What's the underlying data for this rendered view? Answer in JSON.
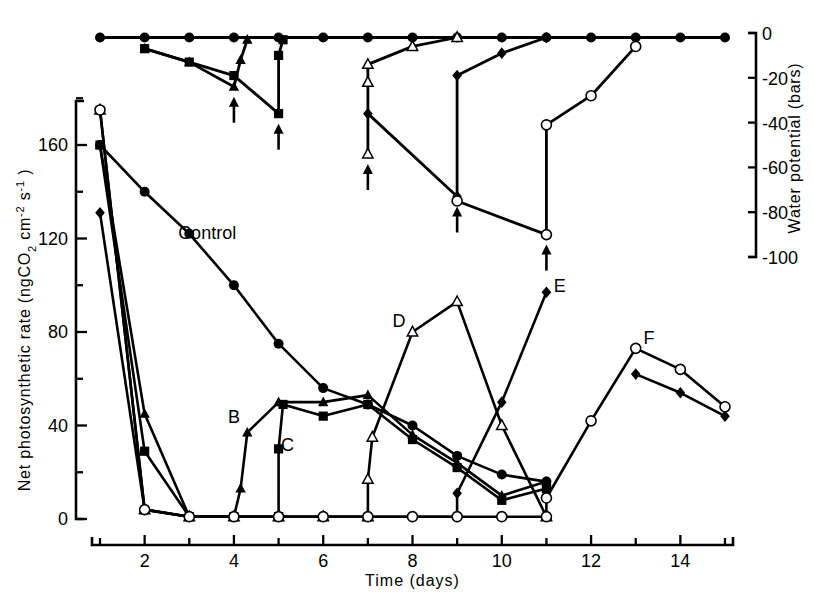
{
  "figure": {
    "title": "",
    "left_axis_label": "Net photosynthetic rate  (ngCO₂ cm⁻² s⁻¹)",
    "right_axis_label": "Water potential  (bars)",
    "x_axis_label": "Time  (days)"
  },
  "chart_data": {
    "type": "line",
    "title": "",
    "xlabel": "Time (days)",
    "ylabel": "Net photosynthetic rate (ngCO2 cm-2 s-1)",
    "ylabel_right": "Water potential (bars)",
    "xlim": [
      1,
      15
    ],
    "ylim": [
      0,
      180
    ],
    "ylim_right": [
      -100,
      0
    ],
    "grid": false,
    "legend": "none",
    "xticks": [
      1,
      2,
      3,
      4,
      5,
      6,
      7,
      8,
      9,
      10,
      11,
      12,
      13,
      14,
      15
    ],
    "xticklabels": [
      "",
      "2",
      "",
      "4",
      "",
      "6",
      "",
      "8",
      "",
      "10",
      "",
      "12",
      "",
      "14",
      ""
    ],
    "yticks_left": [
      0,
      20,
      40,
      60,
      80,
      100,
      120,
      140,
      160,
      180
    ],
    "yticklabels_left": [
      "0",
      "",
      "40",
      "",
      "80",
      "",
      "120",
      "",
      "160",
      ""
    ],
    "yticks_right": [
      0,
      -10,
      -20,
      -30,
      -40,
      -50,
      -60,
      -70,
      -80,
      -90,
      -100
    ],
    "yticklabels_right": [
      "0",
      "",
      "-20",
      "",
      "-40",
      "",
      "-60",
      "",
      "-80",
      "",
      "-100"
    ],
    "annotations": [
      {
        "text": "Control",
        "x": 3.4,
        "y": 120
      },
      {
        "text": "B",
        "x": 4.0,
        "y": 41
      },
      {
        "text": "C",
        "x": 5.2,
        "y": 29
      },
      {
        "text": "D",
        "x": 7.7,
        "y": 82
      },
      {
        "text": "E",
        "x": 11.3,
        "y": 97
      },
      {
        "text": "F",
        "x": 13.3,
        "y": 75
      }
    ],
    "rewater_arrows_panel_top": [
      {
        "x": 4.0,
        "y_bars": -24
      },
      {
        "x": 5.0,
        "y_bars": -36
      },
      {
        "x": 7.0,
        "y_bars": -54
      },
      {
        "x": 9.0,
        "y_bars": -73
      },
      {
        "x": 11.0,
        "y_bars": -90
      }
    ],
    "series_top_panel": [
      {
        "name": "control-water-potential",
        "marker": "filled-circle",
        "x": [
          1,
          2,
          3,
          4,
          5,
          6,
          7,
          8,
          9,
          10,
          11,
          12,
          13,
          14,
          15
        ],
        "y_bars": [
          -2,
          -2,
          -2,
          -2,
          -2,
          -2,
          -2,
          -2,
          -2,
          -2,
          -2,
          -2,
          -2,
          -2,
          -2
        ]
      },
      {
        "name": "B-water-potential-triangle",
        "marker": "filled-triangle",
        "x": [
          2,
          3,
          4,
          4.15,
          4.3
        ],
        "y_bars": [
          -7,
          -13,
          -24,
          -12,
          -3
        ]
      },
      {
        "name": "C-water-potential-square",
        "marker": "filled-square",
        "x": [
          2,
          3,
          4,
          5,
          5,
          5.1
        ],
        "y_bars": [
          -7,
          -13,
          -19,
          -36,
          -10,
          -3
        ]
      },
      {
        "name": "D-water-potential-open-triangle",
        "marker": "open-triangle",
        "x": [
          7,
          7,
          7,
          8,
          9
        ],
        "y_bars": [
          -54,
          -22,
          -14,
          -6,
          -2
        ]
      },
      {
        "name": "E-water-potential-diamond",
        "marker": "filled-diamond",
        "x": [
          7,
          9,
          9,
          10,
          11
        ],
        "y_bars": [
          -36,
          -73,
          -19,
          -9,
          -2
        ]
      },
      {
        "name": "F-water-potential-open-circle",
        "marker": "open-circle",
        "x": [
          9,
          11,
          11,
          12,
          13
        ],
        "y_bars": [
          -75,
          -90,
          -41,
          -28,
          -6
        ]
      }
    ],
    "series_bottom_panel": [
      {
        "name": "Control",
        "marker": "filled-circle",
        "x": [
          1,
          2,
          3,
          4,
          5,
          6,
          7,
          8,
          9,
          10,
          11
        ],
        "y": [
          160,
          140,
          122,
          100,
          75,
          56,
          49,
          40,
          27,
          19,
          16
        ]
      },
      {
        "name": "B",
        "marker": "filled-triangle",
        "x": [
          1,
          2,
          3,
          4,
          4.15,
          4.3,
          5,
          6,
          7,
          8,
          9,
          10,
          11
        ],
        "y": [
          160,
          45,
          1,
          1,
          13,
          37,
          50,
          50,
          53,
          36,
          24,
          10,
          16
        ]
      },
      {
        "name": "C",
        "marker": "filled-square",
        "x": [
          1,
          2,
          3,
          4,
          5,
          5,
          5.1,
          6,
          7,
          8,
          9,
          10,
          11
        ],
        "y": [
          160,
          29,
          1,
          1,
          1,
          30,
          49,
          44,
          49,
          34,
          22,
          8,
          13
        ]
      },
      {
        "name": "D",
        "marker": "open-triangle",
        "x": [
          1,
          2,
          3,
          4,
          5,
          6,
          7,
          7,
          7.1,
          8,
          9,
          10,
          11
        ],
        "y": [
          175,
          4,
          1,
          1,
          1,
          1,
          1,
          17,
          35,
          80,
          93,
          40,
          1
        ]
      },
      {
        "name": "E",
        "marker": "filled-diamond",
        "x": [
          1,
          2,
          3,
          4,
          5,
          6,
          7,
          8,
          9,
          9,
          10,
          11,
          12,
          13,
          14,
          15
        ],
        "y": [
          131,
          4,
          1,
          1,
          1,
          1,
          1,
          1,
          1,
          11,
          50,
          97,
          null,
          62,
          54,
          44
        ]
      },
      {
        "name": "F",
        "marker": "open-circle",
        "x": [
          1,
          2,
          3,
          4,
          5,
          6,
          7,
          8,
          9,
          10,
          11,
          11,
          12,
          13,
          14,
          15
        ],
        "y": [
          175,
          4,
          1,
          1,
          1,
          1,
          1,
          1,
          1,
          1,
          1,
          9,
          42,
          73,
          64,
          48
        ]
      }
    ]
  }
}
